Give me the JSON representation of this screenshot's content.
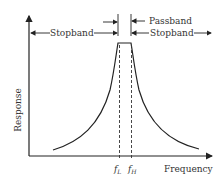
{
  "diagram": {
    "type": "bandpass-filter-response",
    "y_axis_label": "Response",
    "x_axis_label": "Frequency",
    "tick_labels": {
      "low": "f",
      "low_sub": "L",
      "high": "f",
      "high_sub": "H"
    },
    "annotations": {
      "passband": "Passband",
      "stopband_left": "Stopband",
      "stopband_right": "Stopband"
    },
    "colors": {
      "line": "#222222",
      "text": "#333333",
      "background": "#ffffff"
    }
  }
}
